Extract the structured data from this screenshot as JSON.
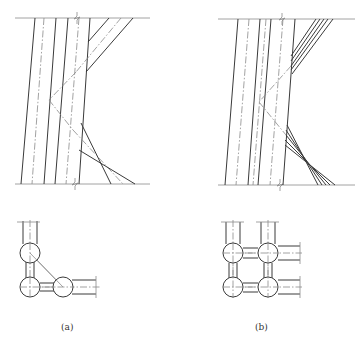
{
  "figure": {
    "panels": [
      {
        "id": "a",
        "caption": "(a)",
        "description": "Elevation of column with single-plane diagonal bracing; plan shows L-shaped connection of three columns"
      },
      {
        "id": "b",
        "caption": "(b)",
        "description": "Elevation of column with multi-member (laced) diagonal bracing; plan shows 2x2 grid of four columns"
      }
    ]
  }
}
